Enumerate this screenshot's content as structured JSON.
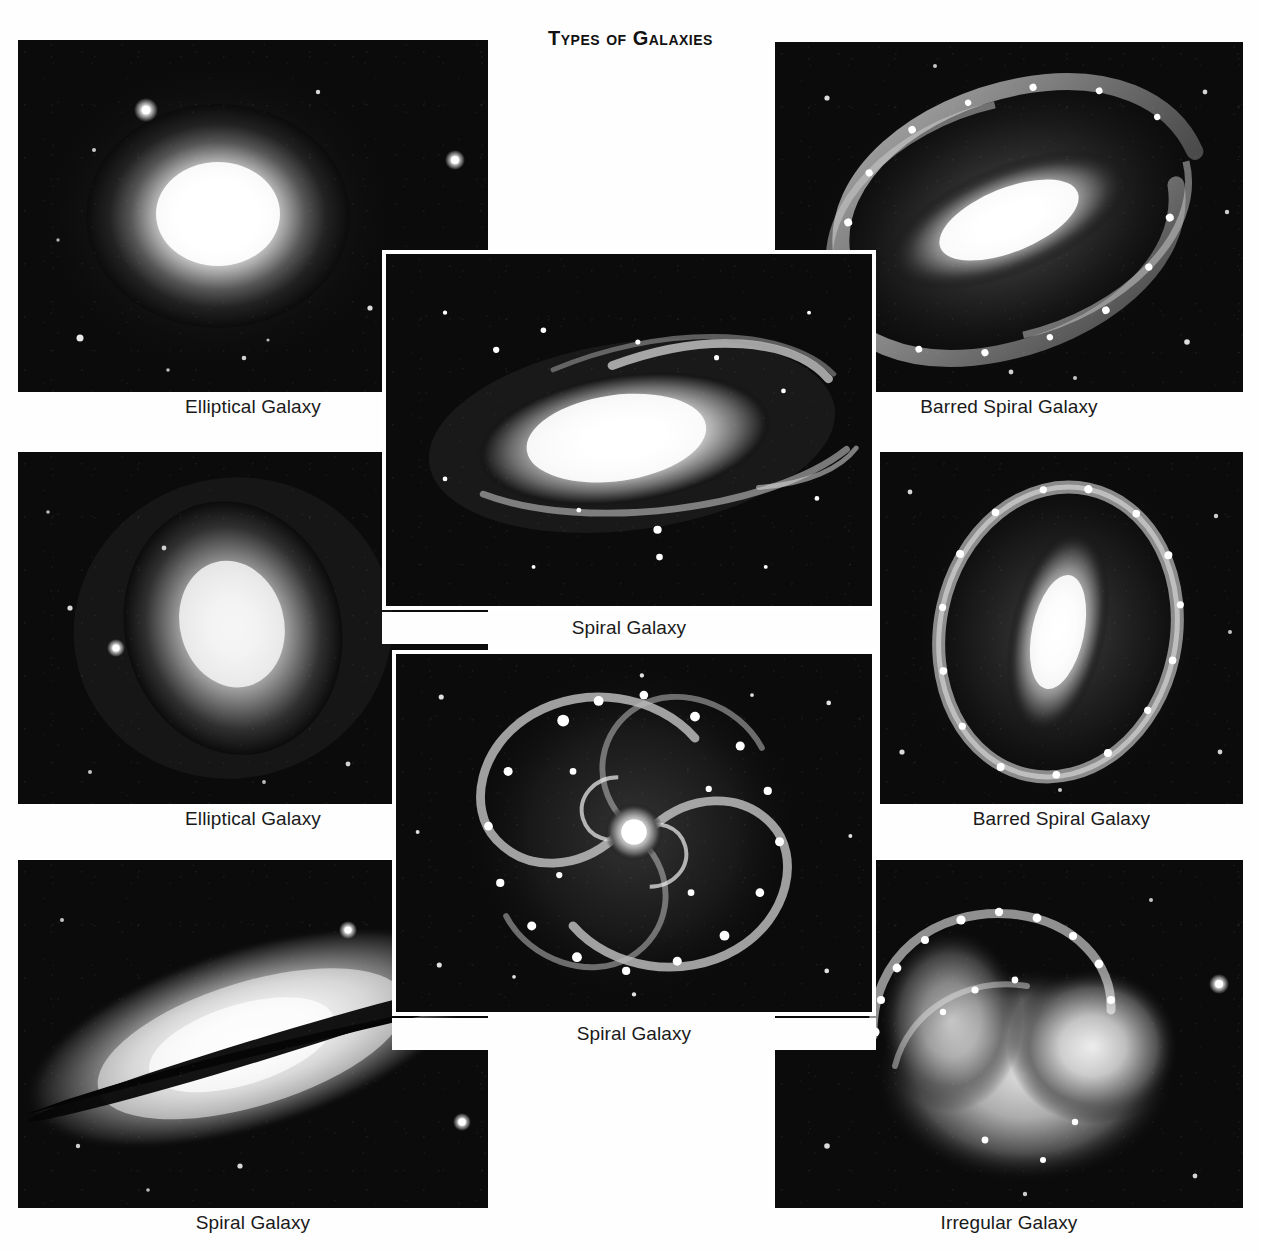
{
  "title": "Types of Galaxies",
  "colors": {
    "page_background": "#fefefe",
    "panel_background": "#0a0a0a",
    "frame": "#ffffff",
    "caption_text": "#1a1a1a",
    "title_text": "#111111",
    "galaxy_light": "#ffffff"
  },
  "panels": [
    {
      "id": "elliptical-top-left",
      "caption": "Elliptical Galaxy",
      "kind": "elliptical",
      "framed": false,
      "rect": {
        "x": 18,
        "y": 40,
        "w": 470,
        "h": 352
      },
      "caption_rect": {
        "x": 18,
        "y": 396,
        "w": 470,
        "h": 30
      }
    },
    {
      "id": "barred-spiral-top-right",
      "caption": "Barred Spiral Galaxy",
      "kind": "barred-spiral",
      "framed": false,
      "rect": {
        "x": 775,
        "y": 42,
        "w": 468,
        "h": 350
      },
      "caption_rect": {
        "x": 775,
        "y": 396,
        "w": 468,
        "h": 30
      }
    },
    {
      "id": "spiral-center-top",
      "caption": "Spiral Galaxy",
      "kind": "spiral-edge-on",
      "framed": true,
      "rect": {
        "x": 382,
        "y": 250,
        "w": 494,
        "h": 360
      },
      "caption_rect": {
        "x": 382,
        "y": 612,
        "w": 494,
        "h": 32
      }
    },
    {
      "id": "elliptical-mid-left",
      "caption": "Elliptical Galaxy",
      "kind": "elliptical",
      "framed": false,
      "rect": {
        "x": 18,
        "y": 452,
        "w": 470,
        "h": 352
      },
      "caption_rect": {
        "x": 18,
        "y": 808,
        "w": 470,
        "h": 30
      }
    },
    {
      "id": "barred-spiral-mid-right",
      "caption": "Barred Spiral Galaxy",
      "kind": "barred-spiral-ring",
      "framed": false,
      "rect": {
        "x": 880,
        "y": 452,
        "w": 363,
        "h": 352
      },
      "caption_rect": {
        "x": 880,
        "y": 808,
        "w": 363,
        "h": 30
      }
    },
    {
      "id": "spiral-center-bottom",
      "caption": "Spiral Galaxy",
      "kind": "spiral-face-on",
      "framed": true,
      "rect": {
        "x": 392,
        "y": 650,
        "w": 484,
        "h": 366
      },
      "caption_rect": {
        "x": 392,
        "y": 1018,
        "w": 484,
        "h": 32
      }
    },
    {
      "id": "spiral-bottom-left",
      "caption": "Spiral Galaxy",
      "kind": "spiral-sombrero",
      "framed": false,
      "rect": {
        "x": 18,
        "y": 860,
        "w": 470,
        "h": 348
      },
      "caption_rect": {
        "x": 18,
        "y": 1212,
        "w": 470,
        "h": 30
      }
    },
    {
      "id": "irregular-bottom-right",
      "caption": "Irregular Galaxy",
      "kind": "irregular",
      "framed": false,
      "rect": {
        "x": 775,
        "y": 860,
        "w": 468,
        "h": 348
      },
      "caption_rect": {
        "x": 775,
        "y": 1212,
        "w": 468,
        "h": 30
      }
    }
  ],
  "captions": {
    "elliptical": "Elliptical Galaxy",
    "spiral": "Spiral Galaxy",
    "barred_spiral": "Barred Spiral Galaxy",
    "irregular": "Irregular Galaxy"
  }
}
